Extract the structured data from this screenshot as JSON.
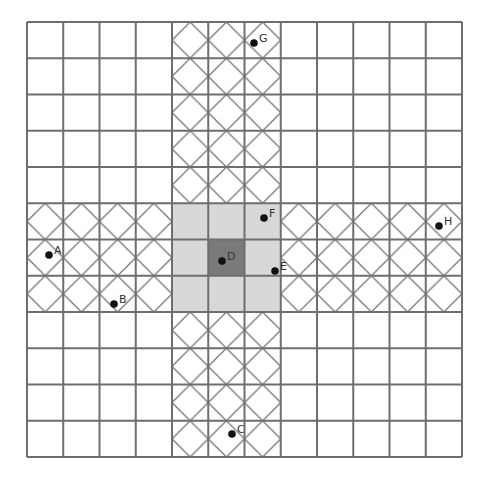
{
  "grid": {
    "cols": 12,
    "rows": 12,
    "x0": 27,
    "y0": 22,
    "cell": 36.25,
    "line_color": "#6e6e6e",
    "hatched_cols": [
      4,
      5,
      6
    ],
    "hatched_rows": [
      5,
      6,
      7
    ],
    "light_fill": "#d8d8d8",
    "dark_fill": "#7a7a7a",
    "center_cell": [
      5,
      6
    ],
    "light_block": {
      "col_start": 4,
      "col_end": 6,
      "row_start": 5,
      "row_end": 7
    }
  },
  "points": [
    {
      "label": "A",
      "x": 49,
      "y": 255
    },
    {
      "label": "B",
      "x": 114,
      "y": 304
    },
    {
      "label": "C",
      "x": 232,
      "y": 434
    },
    {
      "label": "D",
      "x": 222,
      "y": 261
    },
    {
      "label": "E",
      "x": 275,
      "y": 271
    },
    {
      "label": "F",
      "x": 264,
      "y": 218
    },
    {
      "label": "G",
      "x": 254,
      "y": 43
    },
    {
      "label": "H",
      "x": 439,
      "y": 226
    }
  ]
}
